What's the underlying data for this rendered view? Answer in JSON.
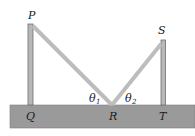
{
  "diagram": {
    "type": "physics-reflection-diagram",
    "labels": {
      "P": "P",
      "S": "S",
      "Q": "Q",
      "R": "R",
      "T": "T",
      "theta1": "θ",
      "theta1_sub": "1",
      "theta2": "θ",
      "theta2_sub": "2"
    },
    "colors": {
      "ground": "#9a9a9a",
      "ground_edge": "#7d7d7d",
      "pole": "#b8b8b8",
      "pole_edge": "#6e6e6e",
      "ray": "#bdbdbd",
      "background": "#ffffff"
    }
  }
}
